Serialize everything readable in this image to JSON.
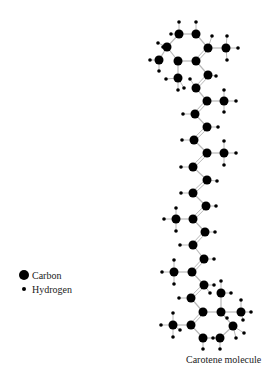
{
  "legend": {
    "carbon_label": "Carbon",
    "hydrogen_label": "Hydrogen"
  },
  "caption": "Carotene molecule",
  "colors": {
    "atom": "#000000",
    "bond": "#b8b8b8"
  },
  "carbons": [
    [
      179,
      34
    ],
    [
      196,
      34
    ],
    [
      167,
      47
    ],
    [
      208,
      48
    ],
    [
      178,
      61
    ],
    [
      196,
      61
    ],
    [
      159,
      60
    ],
    [
      226,
      48
    ],
    [
      178,
      78
    ],
    [
      208,
      75
    ],
    [
      196,
      88
    ],
    [
      207,
      101
    ],
    [
      224,
      101
    ],
    [
      195,
      114
    ],
    [
      207,
      127
    ],
    [
      194,
      140
    ],
    [
      207,
      153
    ],
    [
      224,
      153
    ],
    [
      193,
      167
    ],
    [
      207,
      180
    ],
    [
      193,
      193
    ],
    [
      206,
      206
    ],
    [
      193,
      219
    ],
    [
      176,
      219
    ],
    [
      205,
      232
    ],
    [
      193,
      245
    ],
    [
      204,
      259
    ],
    [
      192,
      272
    ],
    [
      174,
      272
    ],
    [
      204,
      285
    ],
    [
      191,
      298
    ],
    [
      203,
      312
    ],
    [
      221,
      312
    ],
    [
      191,
      325
    ],
    [
      233,
      326
    ],
    [
      203,
      338
    ],
    [
      220,
      338
    ],
    [
      173,
      325
    ],
    [
      221,
      293
    ],
    [
      241,
      312
    ]
  ],
  "bonds": [
    [
      0,
      1
    ],
    [
      0,
      2
    ],
    [
      1,
      3
    ],
    [
      2,
      4
    ],
    [
      3,
      5
    ],
    [
      4,
      5
    ],
    [
      2,
      6
    ],
    [
      3,
      7
    ],
    [
      4,
      8
    ],
    [
      5,
      9
    ],
    [
      9,
      10
    ],
    [
      10,
      11
    ],
    [
      11,
      12
    ],
    [
      11,
      13
    ],
    [
      13,
      14
    ],
    [
      14,
      15
    ],
    [
      15,
      16
    ],
    [
      16,
      17
    ],
    [
      16,
      18
    ],
    [
      18,
      19
    ],
    [
      19,
      20
    ],
    [
      20,
      21
    ],
    [
      21,
      22
    ],
    [
      22,
      23
    ],
    [
      22,
      24
    ],
    [
      24,
      25
    ],
    [
      25,
      26
    ],
    [
      26,
      27
    ],
    [
      27,
      28
    ],
    [
      27,
      29
    ],
    [
      29,
      30
    ],
    [
      30,
      31
    ],
    [
      31,
      32
    ],
    [
      31,
      33
    ],
    [
      32,
      34
    ],
    [
      33,
      35
    ],
    [
      34,
      36
    ],
    [
      35,
      36
    ],
    [
      33,
      37
    ],
    [
      32,
      38
    ],
    [
      32,
      39
    ]
  ],
  "double_bonds": [
    [
      3,
      5
    ],
    [
      9,
      10
    ],
    [
      11,
      13
    ],
    [
      14,
      15
    ],
    [
      16,
      18
    ],
    [
      19,
      20
    ],
    [
      21,
      22
    ],
    [
      24,
      25
    ],
    [
      26,
      27
    ],
    [
      29,
      30
    ],
    [
      31,
      33
    ]
  ],
  "hydrogens": [
    [
      179,
      22
    ],
    [
      196,
      22
    ],
    [
      171,
      34
    ],
    [
      212,
      36
    ],
    [
      158,
      43
    ],
    [
      150,
      60
    ],
    [
      163,
      47
    ],
    [
      159,
      71
    ],
    [
      227,
      36
    ],
    [
      238,
      48
    ],
    [
      227,
      60
    ],
    [
      166,
      79
    ],
    [
      190,
      79
    ],
    [
      178,
      90
    ],
    [
      216,
      76
    ],
    [
      184,
      88
    ],
    [
      224,
      90
    ],
    [
      224,
      112
    ],
    [
      236,
      101
    ],
    [
      183,
      114
    ],
    [
      218,
      127
    ],
    [
      182,
      140
    ],
    [
      224,
      141
    ],
    [
      236,
      153
    ],
    [
      224,
      165
    ],
    [
      181,
      167
    ],
    [
      217,
      181
    ],
    [
      181,
      193
    ],
    [
      216,
      206
    ],
    [
      176,
      208
    ],
    [
      164,
      219
    ],
    [
      176,
      231
    ],
    [
      215,
      232
    ],
    [
      180,
      245
    ],
    [
      214,
      259
    ],
    [
      174,
      260
    ],
    [
      162,
      272
    ],
    [
      174,
      284
    ],
    [
      214,
      285
    ],
    [
      179,
      298
    ],
    [
      221,
      281
    ],
    [
      210,
      293
    ],
    [
      231,
      293
    ],
    [
      241,
      300
    ],
    [
      251,
      312
    ],
    [
      243,
      320
    ],
    [
      227,
      318
    ],
    [
      244,
      333
    ],
    [
      236,
      338
    ],
    [
      213,
      338
    ],
    [
      203,
      349
    ],
    [
      220,
      349
    ],
    [
      173,
      313
    ],
    [
      161,
      325
    ],
    [
      173,
      337
    ],
    [
      180,
      330
    ]
  ]
}
